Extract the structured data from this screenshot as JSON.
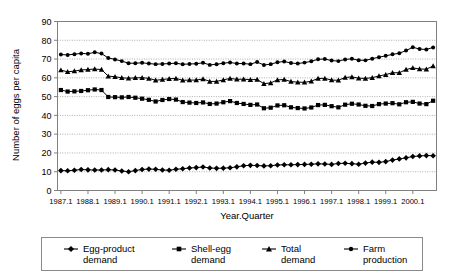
{
  "chart_data": {
    "type": "line",
    "title": "",
    "xlabel": "Year.Quarter",
    "ylabel": "Number of eggs per capita",
    "ylim": [
      0,
      90
    ],
    "ytick_step": 10,
    "yticks": [
      0,
      10,
      20,
      30,
      40,
      50,
      60,
      70,
      80,
      90
    ],
    "grid": true,
    "grid_axis": "y",
    "legend_position": "bottom",
    "xticks": [
      "1987.1",
      "1988.1",
      "1989.1",
      "1990.1",
      "1991.1",
      "1992.1",
      "1993.1",
      "1994.1",
      "1995.1",
      "1996.1",
      "1997.1",
      "1998.1",
      "1999.1",
      "2000.1"
    ],
    "x_note": "Quarterly observations 1987.1 through 2000.4; tick labels mark first quarter of each year",
    "n_points": 56,
    "series": [
      {
        "name": "Egg-product demand",
        "marker": "diamond",
        "values": [
          10.6,
          10.5,
          10.8,
          11.2,
          11.0,
          10.9,
          10.9,
          11.1,
          10.9,
          10.4,
          10.0,
          10.6,
          11.2,
          11.4,
          11.3,
          10.9,
          10.8,
          11.3,
          11.6,
          12.0,
          12.2,
          12.5,
          12.0,
          11.8,
          11.9,
          12.1,
          12.6,
          13.2,
          13.4,
          13.3,
          13.1,
          13.2,
          13.6,
          13.7,
          13.7,
          13.8,
          13.9,
          14.0,
          14.2,
          14.1,
          13.9,
          14.4,
          14.5,
          14.3,
          14.0,
          14.6,
          15.1,
          15.0,
          15.4,
          16.2,
          16.8,
          17.4,
          18.1,
          18.4,
          18.6,
          18.5
        ]
      },
      {
        "name": "Shell-egg demand",
        "marker": "square",
        "values": [
          53.5,
          52.7,
          52.8,
          53.0,
          53.4,
          53.8,
          53.5,
          49.8,
          49.7,
          49.6,
          49.8,
          49.4,
          48.9,
          48.3,
          47.4,
          48.2,
          48.7,
          48.4,
          47.1,
          46.8,
          46.6,
          46.9,
          46.1,
          46.3,
          47.0,
          47.6,
          46.6,
          46.1,
          45.6,
          45.8,
          43.8,
          44.1,
          45.3,
          45.4,
          44.3,
          43.9,
          43.7,
          44.2,
          45.5,
          45.6,
          44.9,
          44.3,
          45.7,
          46.2,
          45.8,
          45.1,
          45.0,
          46.0,
          46.3,
          46.5,
          45.9,
          47.0,
          47.2,
          46.3,
          46.0,
          47.8
        ]
      },
      {
        "name": "Total demand",
        "marker": "triangle",
        "values": [
          64.1,
          63.2,
          63.6,
          64.2,
          64.4,
          64.7,
          64.4,
          60.9,
          60.6,
          60.0,
          59.8,
          60.0,
          60.1,
          59.7,
          58.7,
          59.1,
          59.5,
          59.7,
          58.7,
          58.8,
          58.8,
          59.4,
          58.1,
          58.1,
          58.9,
          59.7,
          59.2,
          59.3,
          59.0,
          59.1,
          56.9,
          57.3,
          58.9,
          59.1,
          58.0,
          57.7,
          57.6,
          58.2,
          59.7,
          59.7,
          58.8,
          58.7,
          60.2,
          60.5,
          59.8,
          59.7,
          60.1,
          61.0,
          61.7,
          62.7,
          62.7,
          64.4,
          65.3,
          64.7,
          64.6,
          66.3
        ]
      },
      {
        "name": "Farm production",
        "marker": "circle",
        "values": [
          72.4,
          72.2,
          72.6,
          73.0,
          72.8,
          73.6,
          72.9,
          70.6,
          69.8,
          68.9,
          67.8,
          67.8,
          68.0,
          67.6,
          67.3,
          67.4,
          67.6,
          67.8,
          67.2,
          67.4,
          67.5,
          68.0,
          66.9,
          67.2,
          67.8,
          68.2,
          67.6,
          67.6,
          67.3,
          68.4,
          66.8,
          67.3,
          68.3,
          68.7,
          67.9,
          67.6,
          68.1,
          68.8,
          69.9,
          70.0,
          69.2,
          68.9,
          69.8,
          70.1,
          69.4,
          69.3,
          70.2,
          71.0,
          71.7,
          72.5,
          73.1,
          74.5,
          76.3,
          75.3,
          75.1,
          76.2
        ]
      }
    ]
  },
  "axes": {
    "y_title": "Number of eggs per capita",
    "x_title": "Year.Quarter"
  },
  "legend": {
    "items": [
      {
        "line1": "Egg-product",
        "line2": "demand",
        "marker": "diamond"
      },
      {
        "line1": "Shell-egg",
        "line2": "demand",
        "marker": "square"
      },
      {
        "line1": "Total",
        "line2": "demand",
        "marker": "triangle"
      },
      {
        "line1": "Farm",
        "line2": "production",
        "marker": "circle"
      }
    ]
  },
  "colors": {
    "series": "#000000",
    "grid": "#9a9a9a",
    "axis": "#808080",
    "background": "#ffffff"
  }
}
